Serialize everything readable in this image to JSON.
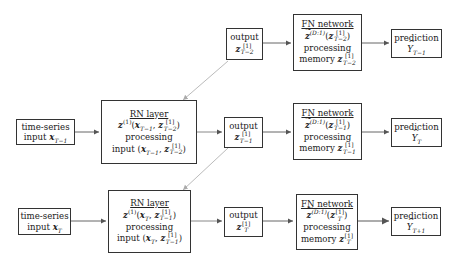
{
  "diagram": {
    "rows": [
      {
        "output": {
          "label": "output",
          "var": "z",
          "sup": "[1]",
          "sub": "T−2"
        },
        "fn": {
          "title": "FN network",
          "eq_fn": "z",
          "eq_sup": "(D:1)",
          "eq_arg_sup": "[1]",
          "eq_arg_sub": "T−2",
          "processing": "processing",
          "memory_label": "memory",
          "mem_sup": "[1]",
          "mem_sub": "T−2"
        },
        "prediction": {
          "label": "prediction",
          "var": "Y",
          "sub": "T−1"
        }
      },
      {
        "input": {
          "label": "time-series",
          "input_label": "input",
          "var": "x",
          "sub": "T−1"
        },
        "rn": {
          "title": "RN layer",
          "eq_fn": "z",
          "eq_sup": "(1)",
          "eq_x_sub": "T−1",
          "eq_z_sup": "[1]",
          "eq_z_sub": "T−2",
          "processing": "processing",
          "input_label": "input"
        },
        "output": {
          "label": "output",
          "var": "z",
          "sup": "[1]",
          "sub": "T−1"
        },
        "fn": {
          "title": "FN network",
          "eq_fn": "z",
          "eq_sup": "(D:1)",
          "eq_arg_sup": "[1]",
          "eq_arg_sub": "T−1",
          "processing": "processing",
          "memory_label": "memory",
          "mem_sup": "[1]",
          "mem_sub": "T−1"
        },
        "prediction": {
          "label": "prediction",
          "var": "Y",
          "sub": "T"
        }
      },
      {
        "input": {
          "label": "time-series",
          "input_label": "input",
          "var": "x",
          "sub": "T"
        },
        "rn": {
          "title": "RN layer",
          "eq_fn": "z",
          "eq_sup": "(1)",
          "eq_x_sub": "T",
          "eq_z_sup": "[1]",
          "eq_z_sub": "T−1",
          "processing": "processing",
          "input_label": "input"
        },
        "output": {
          "label": "output",
          "var": "z",
          "sup": "[1]",
          "sub": "T"
        },
        "fn": {
          "title": "FN network",
          "eq_fn": "z",
          "eq_sup": "(D:1)",
          "eq_arg_sup": "[1]",
          "eq_arg_sub": "T",
          "processing": "processing",
          "memory_label": "memory",
          "mem_sup": "[1]",
          "mem_sub": "T"
        },
        "prediction": {
          "label": "prediction",
          "var": "Y",
          "sub": "T+1"
        }
      }
    ],
    "colors": {
      "edge": "#555555",
      "recurrent_edge": "#bbbbbb",
      "box_border": "#333333"
    }
  }
}
